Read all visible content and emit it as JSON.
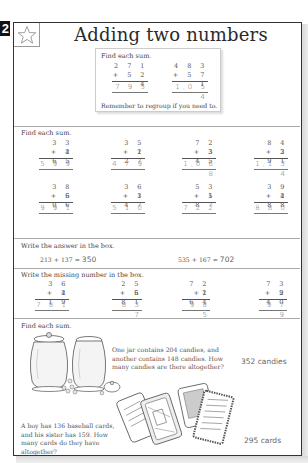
{
  "page": {
    "number": "2",
    "title": "Adding two numbers",
    "star_icon": "star-outline-icon"
  },
  "example": {
    "instruction": "Find each sum.",
    "problems": [
      {
        "top": "2 7 1",
        "bottom": "+ 5 2 4",
        "answer": "7 9 5"
      },
      {
        "top": "4 8 3",
        "bottom": "+ 5 7 1",
        "answer": "1,0 5 4"
      }
    ],
    "note": "Remember to regroup if you need to."
  },
  "section1": {
    "instruction": "Find each sum.",
    "problems": [
      {
        "top": "3 3 4",
        "bottom": "+ 2 6 5",
        "answer": "5 9 9"
      },
      {
        "top": "3 5 2",
        "bottom": "+ 1 2 7",
        "answer": "4 7 9"
      },
      {
        "top": "7 2 3",
        "bottom": "+ 3 4 5",
        "answer": "1,0 6 8"
      },
      {
        "top": "8 4 3",
        "bottom": "+ 2 9 1",
        "answer": "1,1 3 4"
      },
      {
        "top": "3 8 5",
        "bottom": "+ 6 0 6",
        "answer": "9 9 1"
      },
      {
        "top": "3 6 3",
        "bottom": "+ 1 4 7",
        "answer": "5 1 0"
      },
      {
        "top": "5 3 5",
        "bottom": "+ 1 8 7",
        "answer": "7 2 2"
      },
      {
        "top": "3 9 2",
        "bottom": "+ 4 8 8",
        "answer": "8 8 0"
      }
    ]
  },
  "section2": {
    "instruction": "Write the answer in the box.",
    "equations": [
      {
        "expr": "213  +  137  =",
        "answer": "350"
      },
      {
        "expr": "535  +  167  =",
        "answer": "702"
      }
    ]
  },
  "section3": {
    "instruction": "Write the missing number in the box.",
    "problems": [
      {
        "top": "3 6 2",
        "bottom": "+ 4 1 9",
        "answer": "7 8 1"
      },
      {
        "top": "2 5 6",
        "bottom": "+ 5 8 1",
        "answer": "8 3 7"
      },
      {
        "top": "7 2 1",
        "bottom": "+2 6 4",
        "answer": "9 8 5"
      },
      {
        "top": "7 3 9",
        "bottom": "+ 2 4 0",
        "answer": "9 7 9"
      }
    ]
  },
  "section4": {
    "instruction": "Find each sum.",
    "problems": [
      {
        "text": "One jar contains 204 candies, and another contains 148 candies. How many candies are there altogether?",
        "answer": "352 candies",
        "illustration": "candy-jars-illustration"
      },
      {
        "text": "A boy has 136 baseball cards, and his sister has 159. How many cards do they have altogether?",
        "answer": "295 cards",
        "illustration": "baseball-cards-illustration"
      }
    ]
  }
}
